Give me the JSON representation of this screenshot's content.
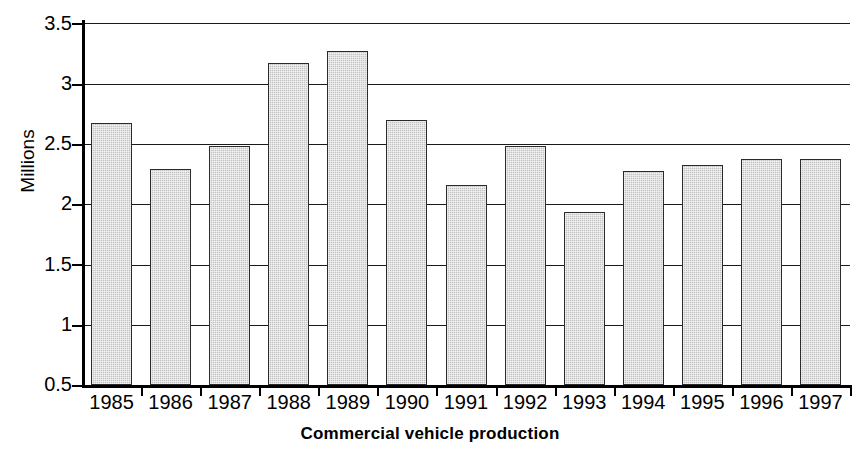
{
  "chart_data": {
    "type": "bar",
    "title": "Commercial vehicle production",
    "xlabel": "",
    "ylabel": "Millions",
    "categories": [
      "1985",
      "1986",
      "1987",
      "1988",
      "1989",
      "1990",
      "1991",
      "1992",
      "1993",
      "1994",
      "1995",
      "1996",
      "1997"
    ],
    "values": [
      2.67,
      2.29,
      2.48,
      3.17,
      3.27,
      2.7,
      2.16,
      2.48,
      1.93,
      2.27,
      2.32,
      2.37,
      2.37
    ],
    "ylim": [
      0.5,
      3.5
    ],
    "yticks": [
      "0.5",
      "1",
      "1.5",
      "2",
      "2.5",
      "3",
      "3.5"
    ],
    "ytick_values": [
      0.5,
      1,
      1.5,
      2,
      2.5,
      3,
      3.5
    ],
    "grid": true,
    "legend": "none",
    "bar_color": "#c3c3c3",
    "bar_edge_color": "#2b2b2b",
    "axis_color": "#000000",
    "background": "#ffffff"
  }
}
